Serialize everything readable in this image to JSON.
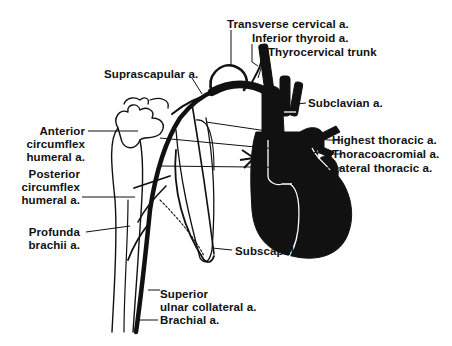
{
  "diagram": {
    "ink_color": "#111111",
    "background": "#ffffff",
    "labels": {
      "transverse_cervical": "Transverse cervical a.",
      "inferior_thyroid": "Inferior thyroid a.",
      "thyrocervical_trunk": "Thyrocervical trunk",
      "suprascapular": "Suprascapular a.",
      "subclavian": "Subclavian a.",
      "anterior_circumflex_1": "Anterior",
      "anterior_circumflex_2": "circumflex",
      "anterior_circumflex_3": "humeral a.",
      "posterior_circumflex_1": "Posterior",
      "posterior_circumflex_2": "circumflex",
      "posterior_circumflex_3": "humeral a.",
      "highest_thoracic": "Highest thoracic a.",
      "thoracoacromial": "Thoracoacromial a.",
      "lateral_thoracic": "Lateral thoracic a.",
      "profunda_1": "Profunda",
      "profunda_2": "brachii a.",
      "subscapular": "Subscapular a.",
      "superior_ulnar_1": "Superior",
      "superior_ulnar_2": "ulnar collateral a.",
      "brachial": "Brachial a."
    }
  }
}
